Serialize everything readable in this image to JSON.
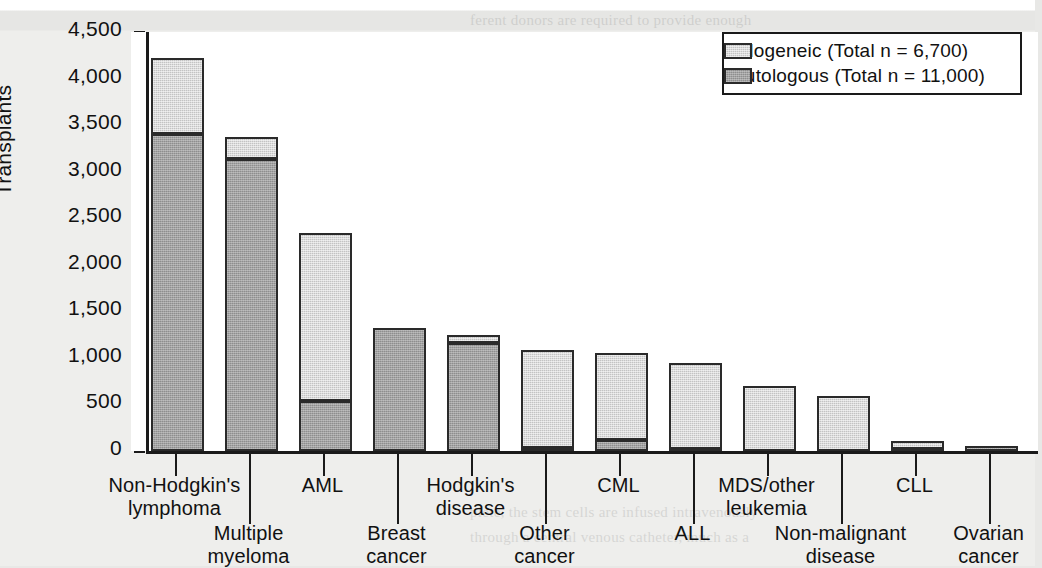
{
  "chart_data": {
    "type": "bar",
    "subtype": "stacked-vertical",
    "title": "",
    "xlabel": "",
    "ylabel": "Transplants",
    "ylim": [
      0,
      4500
    ],
    "ytick_step": 500,
    "yminor_step": 250,
    "grid": false,
    "legend_position": "top-right",
    "categories": [
      "Non-Hodgkin's lymphoma",
      "Multiple myeloma",
      "AML",
      "Breast cancer",
      "Hodgkin's disease",
      "Other cancer",
      "CML",
      "ALL",
      "MDS/other leukemia",
      "Non-malignant disease",
      "CLL",
      "Ovarian cancer"
    ],
    "series": [
      {
        "name": "Autologous",
        "color": "#8e8e8e",
        "values": [
          3400,
          3140,
          535,
          1320,
          1160,
          30,
          120,
          25,
          0,
          0,
          25,
          55
        ]
      },
      {
        "name": "Allogeneic",
        "color": "#c3c3c3",
        "values": [
          820,
          230,
          1805,
          0,
          85,
          1060,
          935,
          920,
          700,
          595,
          80,
          0
        ]
      }
    ],
    "totals": [
      4220,
      3370,
      2340,
      1320,
      1245,
      1090,
      1055,
      945,
      700,
      595,
      105,
      55
    ],
    "ytick_labels": [
      "4,500",
      "4,000",
      "3,500",
      "3,000",
      "2,500",
      "2,000",
      "1,500",
      "1,000",
      "500",
      "0"
    ],
    "ytick_values": [
      4500,
      4000,
      3500,
      3000,
      2500,
      2000,
      1500,
      1000,
      500,
      0
    ]
  },
  "legend": {
    "items": [
      {
        "label": "Allogeneic (Total n = 6,700)",
        "swatch": "allo"
      },
      {
        "label": "Autologous (Total n = 11,000)",
        "swatch": "auto"
      }
    ]
  },
  "xlabels": [
    {
      "text": "Non-Hodgkin's\nlymphoma",
      "row": 0
    },
    {
      "text": "Multiple\nmyeloma",
      "row": 1
    },
    {
      "text": "AML",
      "row": 0
    },
    {
      "text": "Breast\ncancer",
      "row": 1
    },
    {
      "text": "Hodgkin's\ndisease",
      "row": 0
    },
    {
      "text": "Other\ncancer",
      "row": 1
    },
    {
      "text": "CML",
      "row": 0
    },
    {
      "text": "ALL",
      "row": 1
    },
    {
      "text": "MDS/other\nleukemia",
      "row": 0
    },
    {
      "text": "Non-malignant\ndisease",
      "row": 1
    },
    {
      "text": "CLL",
      "row": 0
    },
    {
      "text": "Ovarian\ncancer",
      "row": 1
    }
  ],
  "axis": {
    "y_title": "Transplants"
  },
  "ghost_text": [
    {
      "t": "ferent donors are required to provide enough",
      "x": 470,
      "y": 8
    },
    {
      "t": "such as granulocyte-macrophage colony-stim-",
      "x": 470,
      "y": 112
    },
    {
      "t": "ulating factor (GM-CSF) and granulocyte col-",
      "x": 470,
      "y": 137
    },
    {
      "t": "ony-stimulating factor (G-CSF) are routinely",
      "x": 470,
      "y": 162
    },
    {
      "t": "used to mobilize stem cells into the peripheral",
      "x": 470,
      "y": 187
    },
    {
      "t": "blood prior to collection. Mobilized periph-",
      "x": 470,
      "y": 212
    },
    {
      "t": "eral blood stem cells engraft more rapidly than",
      "x": 470,
      "y": 237
    },
    {
      "t": "marrow-derived cells, reducing the period of",
      "x": 470,
      "y": 262
    },
    {
      "t": "neutropenia and the risk of infection.",
      "x": 470,
      "y": 287
    },
    {
      "t": "TRANSPLANT PROCEDURE",
      "x": 470,
      "y": 330
    },
    {
      "t": "The transplant procedure itself is relatively",
      "x": 470,
      "y": 372
    },
    {
      "t": "simple. After the conditioning regimen is com-",
      "x": 470,
      "y": 397
    },
    {
      "t": "plete, the stem cells are infused intravenously",
      "x": 470,
      "y": 500
    },
    {
      "t": "through a central venous catheter, much as a",
      "x": 470,
      "y": 525
    }
  ]
}
